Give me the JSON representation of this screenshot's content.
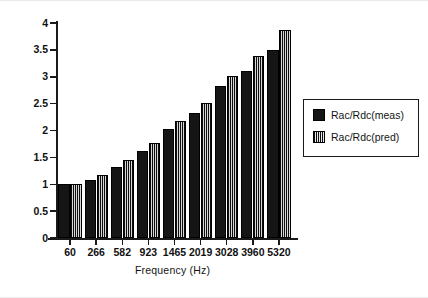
{
  "chart_data": {
    "type": "bar",
    "title": "",
    "subtitle": "",
    "xlabel": "Frequency (Hz)",
    "ylabel": "",
    "categories": [
      "60",
      "266",
      "582",
      "923",
      "1465",
      "2019",
      "3028",
      "3960",
      "5320"
    ],
    "series": [
      {
        "name": "Rac/Rdc(meas)",
        "fill": "solid-black",
        "color": "#151515",
        "values": [
          1.0,
          1.08,
          1.33,
          1.62,
          2.02,
          2.33,
          2.82,
          3.11,
          3.5
        ]
      },
      {
        "name": "Rac/Rdc(pred)",
        "fill": "hatched",
        "color": "#3a3a3a",
        "values": [
          1.0,
          1.17,
          1.46,
          1.77,
          2.18,
          2.51,
          3.01,
          3.38,
          3.87
        ]
      }
    ],
    "ylim": [
      0,
      4
    ],
    "ytick_labels": [
      "0",
      "0.5",
      "1",
      "1.5",
      "2",
      "2.5",
      "3",
      "3.5",
      "4"
    ],
    "ytick_values": [
      0,
      0.5,
      1,
      1.5,
      2,
      2.5,
      3,
      3.5,
      4
    ],
    "grid": false,
    "legend_position": "right",
    "legend_entries": [
      "Rac/Rdc(meas)",
      "Rac/Rdc(pred)"
    ]
  },
  "axes": {
    "x_title": "Frequency (Hz)"
  },
  "legend": {
    "items": [
      {
        "label": "Rac/Rdc(meas)"
      },
      {
        "label": "Rac/Rdc(pred)"
      }
    ]
  }
}
